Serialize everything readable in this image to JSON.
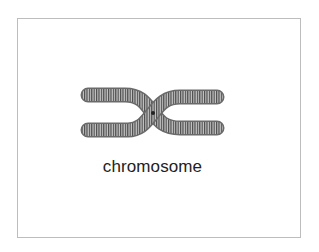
{
  "diagram": {
    "label": "chromosome",
    "colors": {
      "border": "#bdbdbd",
      "coil_dark": "#555555",
      "coil_light": "#b0b0b0",
      "text": "#222222"
    }
  }
}
